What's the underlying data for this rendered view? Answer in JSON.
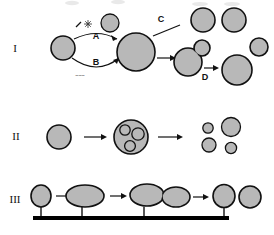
{
  "figure": {
    "background_color": "#ffffff",
    "cell_fill_color": "#b8b8b8",
    "outline_color": "#111111",
    "substrate_color": "#000000"
  },
  "rows": [
    {
      "numeral": "I",
      "name": "row-i-budding-cycle",
      "description": "Single cell undergoes two alternate pathways A and B, enlarges, then buds and separates",
      "labels": [
        {
          "key": "pathway_a",
          "text": "A"
        },
        {
          "key": "pathway_b",
          "text": "B"
        },
        {
          "key": "pathway_c",
          "text": "C"
        },
        {
          "key": "pathway_d",
          "text": "D"
        },
        {
          "key": "stimulus_annotation",
          "text": "~~~"
        }
      ],
      "icons": [
        {
          "key": "star",
          "name": "star-burst-icon"
        },
        {
          "key": "tick",
          "name": "diagonal-tick-icon"
        }
      ],
      "cell_count": 9
    },
    {
      "numeral": "II",
      "name": "row-ii-sporulation",
      "description": "Single cell forms an ascus containing three spores, which are then released as four free spores",
      "labels": [],
      "spores_in_ascus": 3,
      "released_spores": 4,
      "arrow_count": 2
    },
    {
      "numeral": "III",
      "name": "row-iii-surface-attached",
      "description": "Stalked cell attached to a substrate elongates, divides into two, and detaches as two free cells",
      "labels": [],
      "arrow_count": 3,
      "substrate": "horizontal-bar"
    }
  ]
}
